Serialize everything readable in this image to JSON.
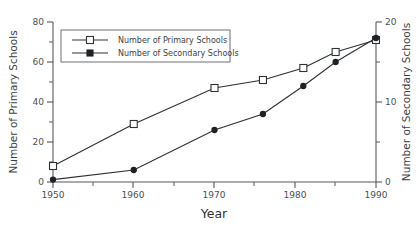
{
  "chart_data": {
    "type": "line",
    "title": "",
    "xlabel": "Year",
    "ylabel": "Number of Primary Schools",
    "y2label": "Number of Secondary Schools",
    "x": [
      1950,
      1960,
      1970,
      1976,
      1981,
      1985,
      1990
    ],
    "xlim": [
      1950,
      1990
    ],
    "ylim": [
      0,
      80
    ],
    "y2lim": [
      0,
      20
    ],
    "xticks": [
      1950,
      1960,
      1970,
      1980,
      1990
    ],
    "xtick_labels": [
      "1950",
      "1960",
      "1970",
      "1980",
      "1990"
    ],
    "xticks_minor": [
      1955,
      1965,
      1975,
      1985
    ],
    "yticks": [
      0,
      20,
      40,
      60,
      80
    ],
    "ytick_labels": [
      "0",
      "20",
      "40",
      "60",
      "80"
    ],
    "yticks_minor": [
      10,
      30,
      50,
      70
    ],
    "y2ticks": [
      0,
      10,
      20
    ],
    "y2tick_labels": [
      "0",
      "10",
      "20"
    ],
    "y2ticks_minor": [
      5,
      15
    ],
    "grid": false,
    "legend_position": "upper-left-inside",
    "series": [
      {
        "name": "Number of Primary Schools",
        "axis": "left",
        "marker": "open-square",
        "values": [
          8,
          29,
          47,
          51,
          57,
          65,
          71
        ]
      },
      {
        "name": "Number of Secondary Schools",
        "axis": "right",
        "marker": "filled-circle",
        "values": [
          0.3,
          1.5,
          6.5,
          8.5,
          12.0,
          15.0,
          18.0
        ]
      }
    ]
  },
  "legend": {
    "entries": [
      {
        "label": "Number of Primary Schools"
      },
      {
        "label": "Number of Secondary Schools"
      }
    ]
  },
  "axes": {
    "x_title": "Year",
    "y_left_title": "Number of Primary Schools",
    "y_right_title": "Number of Secondary Schools"
  }
}
